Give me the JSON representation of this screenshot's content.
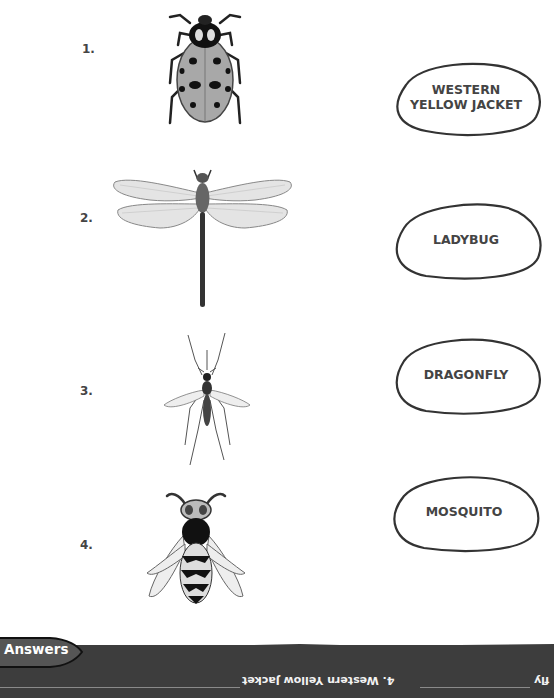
{
  "items": [
    {
      "number": "1.",
      "insect": "ladybug",
      "icon": "ladybug-icon"
    },
    {
      "number": "2.",
      "insect": "dragonfly",
      "icon": "dragonfly-icon"
    },
    {
      "number": "3.",
      "insect": "mosquito",
      "icon": "mosquito-icon"
    },
    {
      "number": "4.",
      "insect": "western yellow jacket",
      "icon": "yellow-jacket-icon"
    }
  ],
  "labels": [
    {
      "line1": "WESTERN",
      "line2": "YELLOW JACKET"
    },
    {
      "line1": "LADYBUG",
      "line2": ""
    },
    {
      "line1": "DRAGONFLY",
      "line2": ""
    },
    {
      "line1": "MOSQUITO",
      "line2": ""
    }
  ],
  "answers": {
    "tab_label": "Answers",
    "upside_down_text": [
      "4. Western Yellow Jacket",
      "fly"
    ]
  },
  "colors": {
    "strip": "#3d3d3d",
    "oval_stroke": "#333333",
    "text": "#444444"
  }
}
